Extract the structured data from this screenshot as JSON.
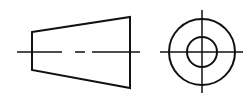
{
  "diagram": {
    "type": "orthographic-projection",
    "stroke_color": "#111111",
    "background": "#ffffff",
    "front_view": {
      "shape": "truncated-cone-side",
      "trapezoid_points": [
        [
          32,
          32
        ],
        [
          130,
          17
        ],
        [
          130,
          88
        ],
        [
          32,
          70
        ]
      ],
      "centerline": {
        "y": 52,
        "dashes": [
          [
            17,
            62
          ],
          [
            75,
            85
          ],
          [
            92,
            140
          ]
        ]
      }
    },
    "side_view": {
      "shape": "concentric-circles",
      "center": [
        202,
        52
      ],
      "outer_radius": 33,
      "inner_radius": 15,
      "crosshair": {
        "horizontal": [
          160,
          243
        ],
        "vertical": [
          10,
          93
        ]
      }
    }
  }
}
